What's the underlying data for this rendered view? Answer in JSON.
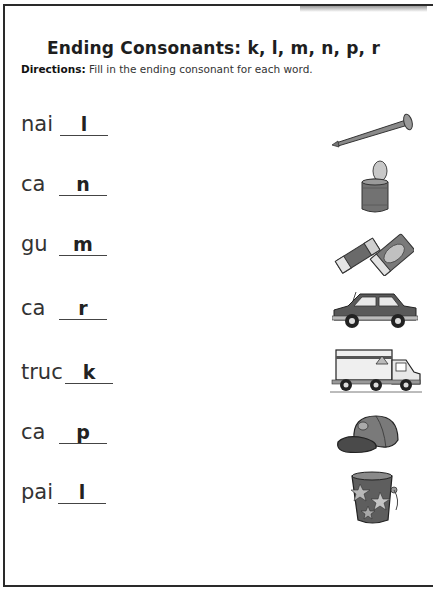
{
  "worksheet": {
    "title": "Ending Consonants: k, l, m, n, p, r",
    "directions_label": "Directions:",
    "directions_text": " Fill in the ending consonant for each word."
  },
  "items": [
    {
      "stem": "nai",
      "answer": "l",
      "picture": "nail-icon"
    },
    {
      "stem": "ca",
      "answer": "n",
      "picture": "tin-can-icon"
    },
    {
      "stem": "gu",
      "answer": "m",
      "picture": "chewing-gum-icon"
    },
    {
      "stem": "ca",
      "answer": "r",
      "picture": "car-icon"
    },
    {
      "stem": "truc",
      "answer": "k",
      "picture": "truck-icon"
    },
    {
      "stem": "ca",
      "answer": "p",
      "picture": "baseball-cap-icon"
    },
    {
      "stem": "pai",
      "answer": "l",
      "picture": "bucket-pail-icon"
    }
  ],
  "colors": {
    "border": "#2a2a2a",
    "text": "#333333",
    "picture_fill": "#6f6f6f",
    "picture_light": "#bdbdbd"
  }
}
